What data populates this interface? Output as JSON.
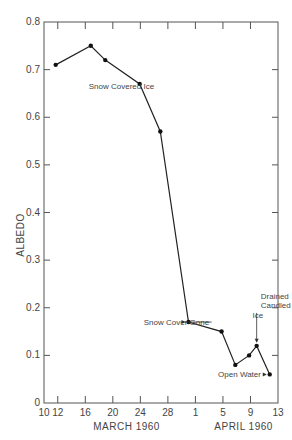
{
  "chart_data": {
    "type": "line",
    "title": "",
    "xlabel": "",
    "ylabel": "ALBEDO",
    "ylim": [
      0,
      0.8
    ],
    "xlim_days_since_mar10": [
      0,
      34
    ],
    "y_ticks": [
      "0",
      "0.1",
      "0.2",
      "0.3",
      "0.4",
      "0.5",
      "0.6",
      "0.7",
      "0.8"
    ],
    "x_ticks": [
      {
        "label": "10",
        "day": 0
      },
      {
        "label": "12",
        "day": 2
      },
      {
        "label": "16",
        "day": 6
      },
      {
        "label": "20",
        "day": 10
      },
      {
        "label": "24",
        "day": 14
      },
      {
        "label": "28",
        "day": 18
      },
      {
        "label": "1",
        "day": 22
      },
      {
        "label": "5",
        "day": 26
      },
      {
        "label": "9",
        "day": 30
      },
      {
        "label": "13",
        "day": 34
      }
    ],
    "x_group_labels": [
      {
        "label": "MARCH  1960",
        "center_day": 12
      },
      {
        "label": "APRIL  1960",
        "center_day": 29
      }
    ],
    "grid": false,
    "series": [
      {
        "name": "Albedo",
        "points": [
          {
            "date": "Mar 12",
            "day": 1.7,
            "value": 0.71
          },
          {
            "date": "Mar 17",
            "day": 6.8,
            "value": 0.75
          },
          {
            "date": "Mar 19",
            "day": 8.9,
            "value": 0.72
          },
          {
            "date": "Mar 24",
            "day": 13.9,
            "value": 0.67
          },
          {
            "date": "Mar 27",
            "day": 16.9,
            "value": 0.57
          },
          {
            "date": "Mar 31",
            "day": 21.0,
            "value": 0.17
          },
          {
            "date": "Apr 4",
            "day": 25.8,
            "value": 0.15
          },
          {
            "date": "Apr 7",
            "day": 27.8,
            "value": 0.08
          },
          {
            "date": "Apr 9",
            "day": 29.8,
            "value": 0.1
          },
          {
            "date": "Apr 10",
            "day": 30.9,
            "value": 0.12
          },
          {
            "date": "Apr 12",
            "day": 32.8,
            "value": 0.06
          }
        ]
      }
    ],
    "annotations": [
      {
        "text": "Snow Covered Ice",
        "day": 6.5,
        "value": 0.665,
        "arrow": false
      },
      {
        "text": "Snow Cover Gone",
        "day": 14.5,
        "value": 0.17,
        "arrow_to_point": 5
      },
      {
        "text": "Drained",
        "day": 31.5,
        "value": 0.225,
        "arrow": false
      },
      {
        "text": "Candled",
        "day": 31.5,
        "value": 0.205,
        "arrow": false
      },
      {
        "text": "Ice",
        "day": 30.3,
        "value": 0.185,
        "arrow_to_point": 9
      },
      {
        "text": "Open Water",
        "day": 25.3,
        "value": 0.06,
        "arrow_to_point": 10
      }
    ]
  }
}
